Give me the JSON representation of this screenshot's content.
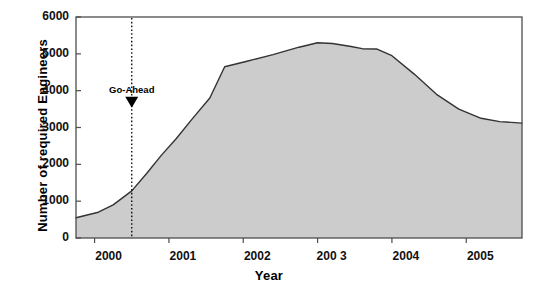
{
  "chart_data": {
    "type": "area",
    "title": "",
    "xlabel": "Year",
    "ylabel": "Number of required Engineers",
    "xlim": [
      1999.75,
      2005.75
    ],
    "ylim": [
      0,
      6000
    ],
    "grid": false,
    "legend": "none",
    "ytick_labels": [
      "6000",
      "5000",
      "4000",
      "3000",
      "2000",
      "1000",
      "0"
    ],
    "ytick_values": [
      6000,
      5000,
      4000,
      3000,
      2000,
      1000,
      0
    ],
    "xtick_labels": [
      "2000",
      "2001",
      "2002",
      "200 3",
      "2004",
      "2005"
    ],
    "xtick_values": [
      2000,
      2001,
      2002,
      2003,
      2004,
      2005
    ],
    "series": [
      {
        "name": "Required Engineers",
        "fill_color": "#cccccc",
        "line_color": "#333333",
        "x": [
          1999.75,
          2000.05,
          2000.25,
          2000.5,
          2000.7,
          2000.9,
          2001.1,
          2001.3,
          2001.55,
          2001.75,
          2002.05,
          2002.4,
          2002.75,
          2003.0,
          2003.2,
          2003.45,
          2003.6,
          2003.8,
          2004.0,
          2004.3,
          2004.6,
          2004.9,
          2005.2,
          2005.45,
          2005.75
        ],
        "y": [
          550,
          700,
          900,
          1280,
          1750,
          2250,
          2700,
          3200,
          3800,
          4650,
          4800,
          4980,
          5180,
          5300,
          5280,
          5200,
          5140,
          5130,
          4950,
          4450,
          3900,
          3500,
          3250,
          3160,
          3120
        ]
      }
    ],
    "annotations": [
      {
        "name": "go-ahead-marker",
        "label": "Go-Ahead",
        "x": 2000.5,
        "marker": "down-triangle",
        "line_style": "dotted",
        "line_color": "#000000",
        "label_y": 3700
      }
    ]
  },
  "axes": {
    "frame_color": "#4d4d4d",
    "background": "#ffffff"
  }
}
